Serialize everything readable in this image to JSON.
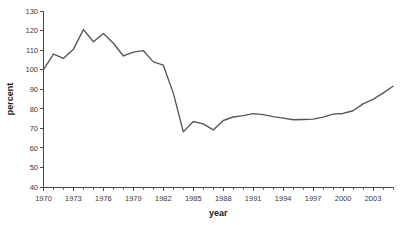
{
  "chart_data": {
    "type": "line",
    "title": "",
    "xlabel": "year",
    "ylabel": "percent",
    "xlim": [
      1970,
      2005
    ],
    "ylim": [
      40,
      130
    ],
    "ytick_step": 10,
    "yticks": [
      40,
      50,
      60,
      70,
      80,
      90,
      100,
      110,
      120,
      130
    ],
    "ytick_labels": [
      "40",
      "50",
      "60",
      "70",
      "80",
      "90",
      "100",
      "110",
      "120",
      "130"
    ],
    "xticks": [
      1970,
      1971,
      1972,
      1973,
      1974,
      1975,
      1976,
      1977,
      1978,
      1979,
      1980,
      1981,
      1982,
      1983,
      1984,
      1985,
      1986,
      1987,
      1988,
      1989,
      1990,
      1991,
      1992,
      1993,
      1994,
      1995,
      1996,
      1997,
      1998,
      1999,
      2000,
      2001,
      2002,
      2003,
      2004,
      2005
    ],
    "xtick_labels_shown": [
      "1970",
      "1973",
      "1976",
      "1979",
      "1982",
      "1985",
      "1988",
      "1991",
      "1994",
      "1997",
      "2000",
      "2003"
    ],
    "xtick_label_years": [
      1970,
      1973,
      1976,
      1979,
      1982,
      1985,
      1988,
      1991,
      1994,
      1997,
      2000,
      2003
    ],
    "xtick_label_interval": 3,
    "grid": false,
    "legend": false,
    "legend_position": "none",
    "line_color": "#555555",
    "axis_color": "#4a4a4a",
    "background_color": "#ffffff",
    "x": [
      1970,
      1971,
      1972,
      1973,
      1974,
      1975,
      1976,
      1977,
      1978,
      1979,
      1980,
      1981,
      1982,
      1983,
      1984,
      1985,
      1986,
      1987,
      1988,
      1989,
      1990,
      1991,
      1992,
      1993,
      1994,
      1995,
      1996,
      1997,
      1998,
      1999,
      2000,
      2001,
      2002,
      2003,
      2004,
      2005
    ],
    "values": [
      100.0,
      108.0,
      105.8,
      110.5,
      120.5,
      114.3,
      118.5,
      113.5,
      107.0,
      109.0,
      109.7,
      104.0,
      102.3,
      88.0,
      68.2,
      73.5,
      72.3,
      69.2,
      74.0,
      75.8,
      76.5,
      77.5,
      77.0,
      76.0,
      75.2,
      74.4,
      74.5,
      74.7,
      75.7,
      77.3,
      77.6,
      79.0,
      82.5,
      84.8,
      88.0,
      91.5
    ],
    "series": [
      {
        "name": "percent",
        "values": [
          100.0,
          108.0,
          105.8,
          110.5,
          120.5,
          114.3,
          118.5,
          113.5,
          107.0,
          109.0,
          109.7,
          104.0,
          102.3,
          88.0,
          68.2,
          73.5,
          72.3,
          69.2,
          74.0,
          75.8,
          76.5,
          77.5,
          77.0,
          76.0,
          75.2,
          74.4,
          74.5,
          74.7,
          75.7,
          77.3,
          77.6,
          79.0,
          82.5,
          84.8,
          88.0,
          91.5
        ]
      }
    ]
  }
}
